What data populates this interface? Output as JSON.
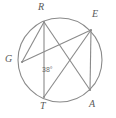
{
  "figure": {
    "stroke_color": "#8a8a8a",
    "label_color": "#5a5a5a",
    "background": "#ffffff",
    "circle": {
      "cx": 60,
      "cy": 60,
      "r": 42
    },
    "points": [
      {
        "id": "R",
        "label": "R",
        "x": 44,
        "y": 22,
        "label_x": 38,
        "label_y": 2
      },
      {
        "id": "E",
        "label": "E",
        "x": 91,
        "y": 30,
        "label_x": 92,
        "label_y": 9
      },
      {
        "id": "G",
        "label": "G",
        "x": 22,
        "y": 62,
        "label_x": 5,
        "label_y": 54
      },
      {
        "id": "T",
        "label": "T",
        "x": 44,
        "y": 97,
        "label_x": 40,
        "label_y": 101
      },
      {
        "id": "A",
        "label": "A",
        "x": 90,
        "y": 90,
        "label_x": 89,
        "label_y": 99
      }
    ],
    "chords": [
      {
        "id": "RG",
        "from": "R",
        "to": "G"
      },
      {
        "id": "RT",
        "from": "R",
        "to": "T"
      },
      {
        "id": "RA",
        "from": "R",
        "to": "A"
      },
      {
        "id": "GE",
        "from": "G",
        "to": "E"
      },
      {
        "id": "TE",
        "from": "T",
        "to": "E"
      },
      {
        "id": "EA",
        "from": "E",
        "to": "A"
      }
    ],
    "angles": [
      {
        "id": "angle-T",
        "vertex": "T",
        "value": "38",
        "unit": "°",
        "text": "38°",
        "x": 42,
        "y": 66
      }
    ]
  }
}
